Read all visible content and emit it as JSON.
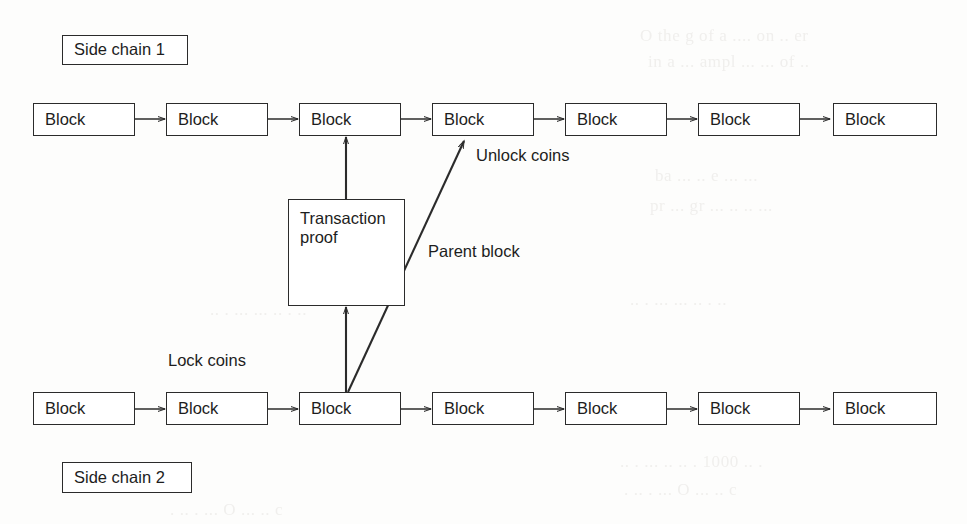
{
  "diagram": {
    "type": "block-chain-flow",
    "stroke_color": "#2b2b2b",
    "background_color": "#fdfdfc",
    "chain_labels": [
      {
        "id": "side-chain-1",
        "text": "Side chain 1"
      },
      {
        "id": "side-chain-2",
        "text": "Side chain 2"
      }
    ],
    "top_chain": {
      "name": "Side chain 1",
      "blocks": [
        {
          "label": "Block"
        },
        {
          "label": "Block"
        },
        {
          "label": "Block"
        },
        {
          "label": "Block"
        },
        {
          "label": "Block"
        },
        {
          "label": "Block"
        },
        {
          "label": "Block"
        }
      ]
    },
    "bottom_chain": {
      "name": "Side chain 2",
      "blocks": [
        {
          "label": "Block"
        },
        {
          "label": "Block"
        },
        {
          "label": "Block"
        },
        {
          "label": "Block"
        },
        {
          "label": "Block"
        },
        {
          "label": "Block"
        },
        {
          "label": "Block"
        }
      ]
    },
    "proof_box": {
      "line1": "Transaction",
      "line2": "proof"
    },
    "annotations": [
      {
        "id": "unlock-coins",
        "text": "Unlock coins"
      },
      {
        "id": "parent-block",
        "text": "Parent block"
      },
      {
        "id": "lock-coins",
        "text": "Lock coins"
      }
    ],
    "bleed_text": [
      "O  the  g  of  a  ....  on  ..  er",
      "in  a  ...  ampl  ...  ...  of  ..",
      "ba  ...  ..  e  ...  ...",
      "pr  ...  gr  ...  ..  ..  ...",
      "..  .  ...  ...  ..  .  ..",
      "..  .  ...  ..  ..  . 1000  ..  .",
      ".  ..  .  ...  O  ...  ..  c"
    ]
  }
}
